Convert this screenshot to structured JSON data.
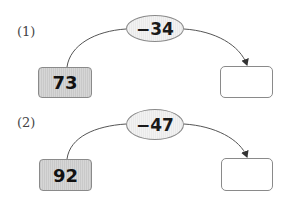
{
  "problems": [
    {
      "label": "(1)",
      "start": "73",
      "operation": "−34",
      "answer": ""
    },
    {
      "label": "(2)",
      "start": "92",
      "operation": "−47",
      "answer": ""
    }
  ],
  "colors": {
    "start_fill": "#cfcfcf",
    "op_fill": "#ececec",
    "border": "#8a8a8a",
    "line": "#555555"
  }
}
